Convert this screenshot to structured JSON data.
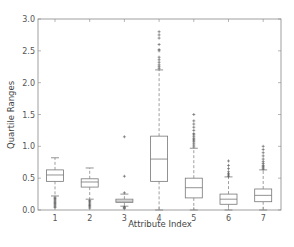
{
  "chart_data": {
    "type": "box",
    "title": "",
    "xlabel": "Attribute Index",
    "ylabel": "Quartile Ranges",
    "ylim": [
      0.0,
      3.0
    ],
    "yticks": [
      0.0,
      0.5,
      1.0,
      1.5,
      2.0,
      2.5,
      3.0
    ],
    "ytick_labels": [
      "0.0",
      "0.5",
      "1.0",
      "1.5",
      "2.0",
      "2.5",
      "3.0"
    ],
    "categories": [
      "1",
      "2",
      "3",
      "4",
      "5",
      "6",
      "7"
    ],
    "grid": false,
    "boxes": [
      {
        "label": "1",
        "whisker_low": 0.22,
        "q1": 0.45,
        "median": 0.55,
        "q3": 0.63,
        "whisker_high": 0.82,
        "outliers": [
          0.04,
          0.06,
          0.08,
          0.1,
          0.12,
          0.14,
          0.16,
          0.18,
          0.2
        ]
      },
      {
        "label": "2",
        "whisker_low": 0.17,
        "q1": 0.36,
        "median": 0.44,
        "q3": 0.49,
        "whisker_high": 0.66,
        "outliers": [
          0.03,
          0.05,
          0.07,
          0.09,
          0.11,
          0.13,
          0.15
        ]
      },
      {
        "label": "3",
        "whisker_low": 0.06,
        "q1": 0.12,
        "median": 0.14,
        "q3": 0.17,
        "whisker_high": 0.25,
        "outliers": [
          0.02,
          0.03,
          0.04,
          0.05,
          0.27,
          0.53,
          1.15
        ]
      },
      {
        "label": "4",
        "whisker_low": 0.0,
        "q1": 0.45,
        "median": 0.8,
        "q3": 1.16,
        "whisker_high": 2.2,
        "outliers": [
          2.22,
          2.25,
          2.28,
          2.32,
          2.36,
          2.4,
          2.5,
          2.52,
          2.6,
          2.7,
          2.75,
          2.8
        ]
      },
      {
        "label": "5",
        "whisker_low": 0.0,
        "q1": 0.19,
        "median": 0.35,
        "q3": 0.5,
        "whisker_high": 0.97,
        "outliers": [
          0.99,
          1.02,
          1.05,
          1.08,
          1.1,
          1.12,
          1.15,
          1.18,
          1.2,
          1.25,
          1.3,
          1.35,
          1.4,
          1.5
        ]
      },
      {
        "label": "6",
        "whisker_low": 0.0,
        "q1": 0.09,
        "median": 0.17,
        "q3": 0.25,
        "whisker_high": 0.52,
        "outliers": [
          0.53,
          0.55,
          0.57,
          0.6,
          0.65,
          0.7,
          0.77
        ]
      },
      {
        "label": "7",
        "whisker_low": 0.0,
        "q1": 0.13,
        "median": 0.23,
        "q3": 0.33,
        "whisker_high": 0.63,
        "outliers": [
          0.64,
          0.66,
          0.68,
          0.7,
          0.73,
          0.76,
          0.8,
          0.85,
          0.9,
          0.95,
          1.0
        ]
      }
    ]
  },
  "style": {
    "box_color": "#777777",
    "axis_color": "#888888",
    "background": "#ffffff"
  }
}
